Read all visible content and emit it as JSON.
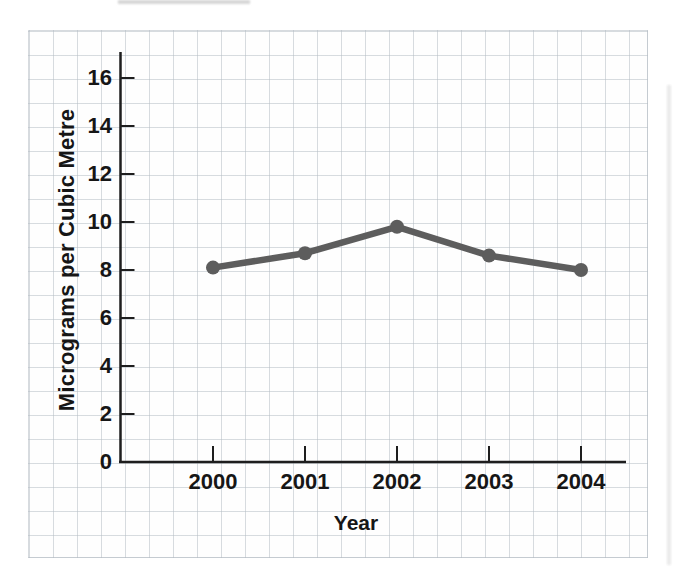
{
  "page": {
    "background": "#ffffff"
  },
  "chart_data": {
    "type": "line",
    "title": "",
    "x": [
      "2000",
      "2001",
      "2002",
      "2003",
      "2004"
    ],
    "series": [
      {
        "name": "micrograms-per-cubic-metre",
        "values": [
          8.1,
          8.7,
          9.8,
          8.6,
          8.0
        ]
      }
    ],
    "xlabel": "Year",
    "ylabel": "Micrograms per Cubic Metre",
    "yticks": [
      0,
      2,
      4,
      6,
      8,
      10,
      12,
      14,
      16
    ],
    "ylim": [
      0,
      17
    ],
    "grid": true,
    "legend": "none",
    "line_color": "#5d5d5d",
    "marker_color": "#5d5d5d",
    "axis_color": "#1e1e1e",
    "text_color": "#161616",
    "grid_color": "#dadee2"
  }
}
